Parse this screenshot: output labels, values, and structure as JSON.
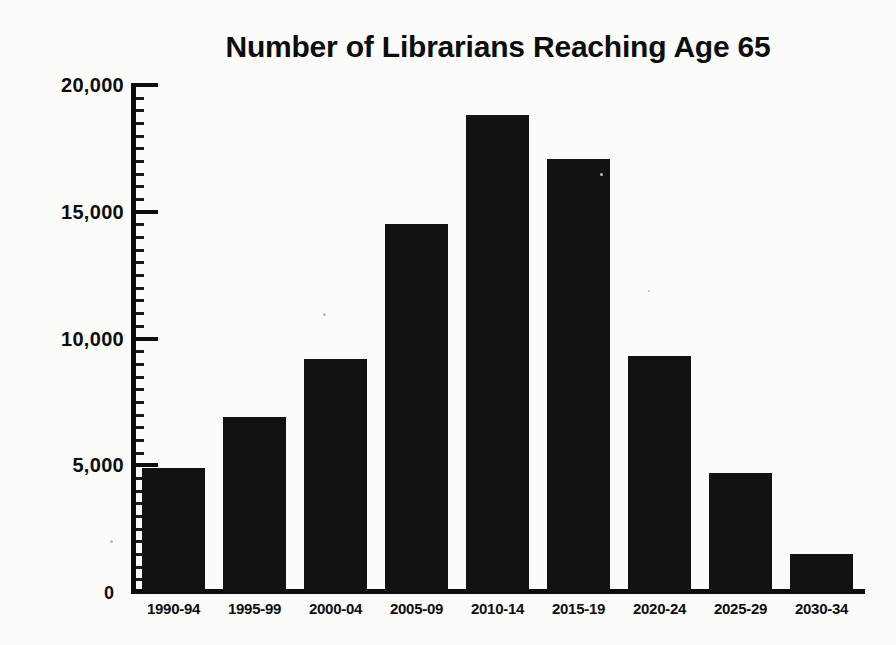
{
  "chart_data": {
    "type": "bar",
    "title": "Number of Librarians Reaching Age 65",
    "xlabel": "",
    "ylabel": "",
    "categories": [
      "1990-94",
      "1995-99",
      "2000-04",
      "2005-09",
      "2010-14",
      "2015-19",
      "2020-24",
      "2025-29",
      "2030-34"
    ],
    "values": [
      4900,
      6900,
      9200,
      14500,
      18800,
      17100,
      9300,
      4700,
      1500
    ],
    "ylim": [
      0,
      20000
    ],
    "ytick_labels": [
      "20,000",
      "15,000",
      "10,000",
      "5,000",
      "0"
    ],
    "ytick_values": [
      20000,
      15000,
      10000,
      5000,
      0
    ],
    "grid": false,
    "legend": null,
    "legend_position": "none",
    "bar_color": "#121212",
    "background_color": "#fbfbfa",
    "text_color": "#0d0d0d",
    "series": [
      {
        "name": "Librarians reaching age 65",
        "values": [
          4900,
          6900,
          9200,
          14500,
          18800,
          17100,
          9300,
          4700,
          1500
        ]
      }
    ]
  },
  "axis": {
    "y_label_0": "0",
    "y_label_5k": "5,000",
    "y_label_10k": "10,000",
    "y_label_15k": "15,000",
    "y_label_20k": "20,000"
  },
  "bars": [
    {
      "category": "1990-94",
      "value": 4900
    },
    {
      "category": "1995-99",
      "value": 6900
    },
    {
      "category": "2000-04",
      "value": 9200
    },
    {
      "category": "2005-09",
      "value": 14500
    },
    {
      "category": "2010-14",
      "value": 18800
    },
    {
      "category": "2015-19",
      "value": 17100
    },
    {
      "category": "2020-24",
      "value": 9300
    },
    {
      "category": "2025-29",
      "value": 4700
    },
    {
      "category": "2030-34",
      "value": 1500
    }
  ]
}
